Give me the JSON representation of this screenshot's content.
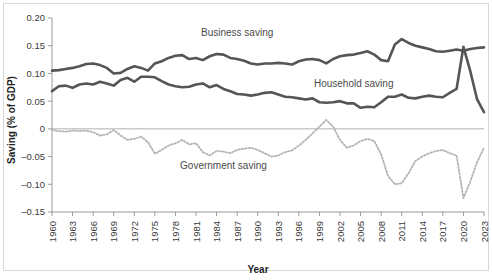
{
  "chart_data": {
    "type": "line",
    "title": "",
    "xlabel": "Year",
    "ylabel": "Saving (% of GDP)",
    "xlim": [
      1960,
      2023
    ],
    "ylim": [
      -0.15,
      0.2
    ],
    "grid": false,
    "legend_position": "inline-annotations",
    "zero_line": true,
    "x": [
      1960,
      1961,
      1962,
      1963,
      1964,
      1965,
      1966,
      1967,
      1968,
      1969,
      1970,
      1971,
      1972,
      1973,
      1974,
      1975,
      1976,
      1977,
      1978,
      1979,
      1980,
      1981,
      1982,
      1983,
      1984,
      1985,
      1986,
      1987,
      1988,
      1989,
      1990,
      1991,
      1992,
      1993,
      1994,
      1995,
      1996,
      1997,
      1998,
      1999,
      2000,
      2001,
      2002,
      2003,
      2004,
      2005,
      2006,
      2007,
      2008,
      2009,
      2010,
      2011,
      2012,
      2013,
      2014,
      2015,
      2016,
      2017,
      2018,
      2019,
      2020,
      2021,
      2022,
      2023
    ],
    "xticks": [
      1960,
      1963,
      1966,
      1969,
      1972,
      1975,
      1978,
      1981,
      1984,
      1987,
      1990,
      1993,
      1996,
      1999,
      2002,
      2005,
      2008,
      2011,
      2014,
      2017,
      2020,
      2023
    ],
    "xtick_labels": [
      "1960",
      "1963",
      "1966",
      "1969",
      "1972",
      "1975",
      "1978",
      "1981",
      "1984",
      "1987",
      "1990",
      "1993",
      "1996",
      "1999",
      "2002",
      "2005",
      "2008",
      "2011",
      "2014",
      "2017",
      "2020",
      "2023"
    ],
    "yticks": [
      -0.15,
      -0.1,
      -0.05,
      0,
      0.05,
      0.1,
      0.15,
      0.2
    ],
    "ytick_labels": [
      "–0.15",
      "–0.10",
      "–0.05",
      "0",
      "0.05",
      "0.10",
      "0.15",
      "0.20"
    ],
    "series": [
      {
        "name": "Business saving",
        "color": "#555555",
        "style": "solid",
        "width": 2.6,
        "label_x": 1987,
        "label_y": 0.168,
        "values": [
          0.105,
          0.106,
          0.108,
          0.11,
          0.113,
          0.117,
          0.118,
          0.115,
          0.11,
          0.1,
          0.101,
          0.108,
          0.113,
          0.11,
          0.105,
          0.118,
          0.122,
          0.128,
          0.132,
          0.133,
          0.126,
          0.128,
          0.124,
          0.131,
          0.135,
          0.134,
          0.128,
          0.126,
          0.123,
          0.118,
          0.116,
          0.118,
          0.118,
          0.119,
          0.118,
          0.116,
          0.122,
          0.125,
          0.126,
          0.124,
          0.118,
          0.126,
          0.131,
          0.133,
          0.134,
          0.137,
          0.14,
          0.134,
          0.124,
          0.122,
          0.152,
          0.162,
          0.155,
          0.15,
          0.147,
          0.144,
          0.14,
          0.139,
          0.141,
          0.143,
          0.141,
          0.144,
          0.146,
          0.147
        ]
      },
      {
        "name": "Household saving",
        "color": "#555555",
        "style": "solid",
        "width": 2.6,
        "label_x": 2004,
        "label_y": 0.076,
        "values": [
          0.068,
          0.077,
          0.078,
          0.074,
          0.08,
          0.082,
          0.08,
          0.085,
          0.082,
          0.078,
          0.088,
          0.092,
          0.085,
          0.094,
          0.094,
          0.093,
          0.086,
          0.08,
          0.077,
          0.075,
          0.076,
          0.08,
          0.082,
          0.075,
          0.079,
          0.072,
          0.068,
          0.063,
          0.062,
          0.06,
          0.062,
          0.065,
          0.066,
          0.062,
          0.058,
          0.057,
          0.055,
          0.053,
          0.055,
          0.048,
          0.047,
          0.048,
          0.05,
          0.046,
          0.046,
          0.038,
          0.04,
          0.039,
          0.048,
          0.058,
          0.058,
          0.062,
          0.056,
          0.055,
          0.058,
          0.06,
          0.058,
          0.057,
          0.065,
          0.072,
          0.148,
          0.104,
          0.053,
          0.03
        ]
      },
      {
        "name": "Government saving",
        "color": "#b3b3b3",
        "style": "dotted",
        "width": 1.8,
        "label_x": 1985,
        "label_y": -0.072,
        "values": [
          -0.002,
          -0.004,
          -0.005,
          -0.003,
          -0.004,
          -0.003,
          -0.006,
          -0.012,
          -0.01,
          -0.002,
          -0.012,
          -0.02,
          -0.018,
          -0.014,
          -0.024,
          -0.045,
          -0.038,
          -0.03,
          -0.026,
          -0.02,
          -0.028,
          -0.026,
          -0.042,
          -0.048,
          -0.04,
          -0.041,
          -0.044,
          -0.038,
          -0.036,
          -0.034,
          -0.038,
          -0.044,
          -0.05,
          -0.048,
          -0.042,
          -0.039,
          -0.03,
          -0.02,
          -0.008,
          0.004,
          0.016,
          0.004,
          -0.02,
          -0.034,
          -0.03,
          -0.022,
          -0.018,
          -0.022,
          -0.046,
          -0.085,
          -0.1,
          -0.098,
          -0.08,
          -0.058,
          -0.05,
          -0.044,
          -0.04,
          -0.038,
          -0.044,
          -0.048,
          -0.125,
          -0.095,
          -0.06,
          -0.034
        ]
      }
    ]
  },
  "axis": {
    "y_title": "Saving (% of GDP)",
    "x_title": "Year"
  }
}
